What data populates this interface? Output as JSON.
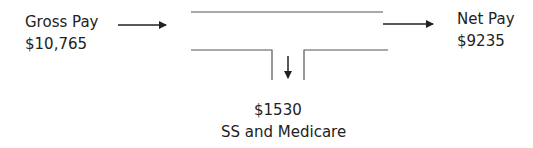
{
  "diagram": {
    "input": {
      "label": "Gross Pay",
      "value": "$10,765"
    },
    "output": {
      "label": "Net Pay",
      "value": "$9235"
    },
    "deduction": {
      "value": "$1530",
      "label": "SS and Medicare"
    }
  },
  "colors": {
    "line": "#222222",
    "pipe": "#555555",
    "text": "#222222"
  }
}
